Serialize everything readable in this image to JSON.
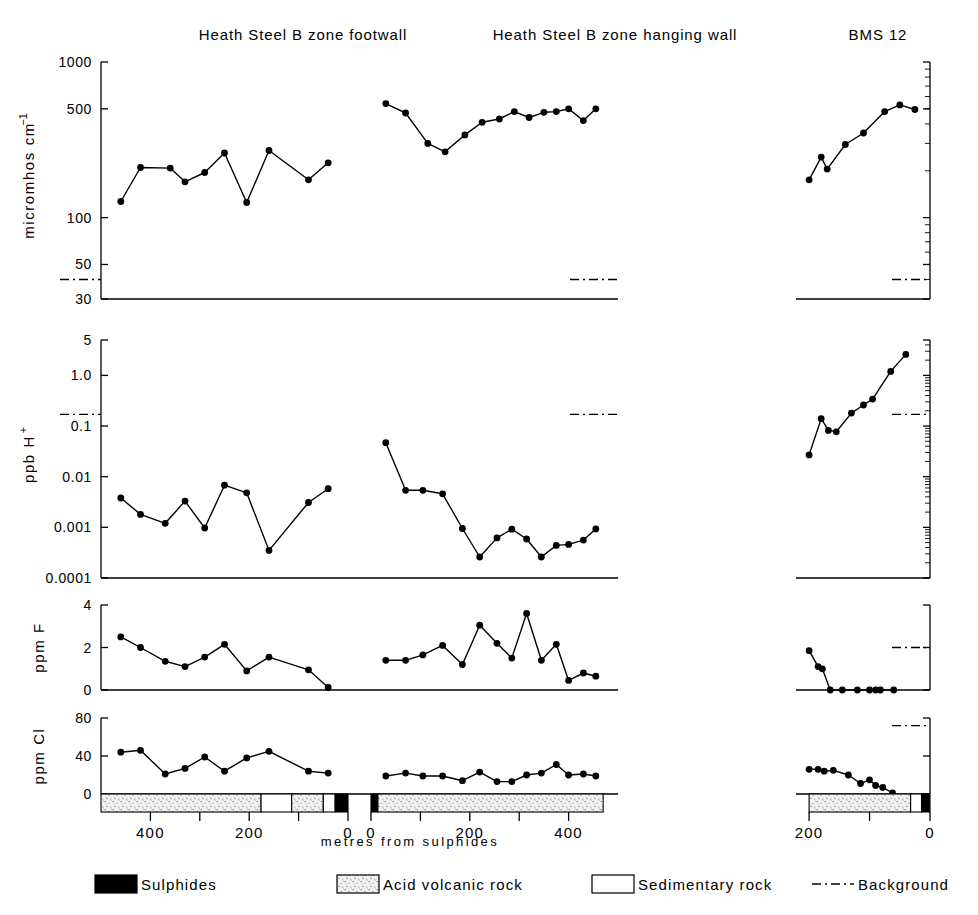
{
  "figure": {
    "xlabel": "metres from sulphides",
    "column_titles": [
      "Heath Steel B zone footwall",
      "Heath Steel B zone hanging wall",
      "BMS 12"
    ]
  },
  "legend": {
    "items": [
      {
        "label": "Sulphides",
        "swatch": "solid-black",
        "color": "#000000"
      },
      {
        "label": "Acid volcanic rock",
        "swatch": "stippled",
        "color": "#efefef"
      },
      {
        "label": "Sedimentary rock",
        "swatch": "white",
        "color": "#ffffff"
      },
      {
        "label": "Background",
        "swatch": "dash-dot-line",
        "color": "#000000"
      }
    ]
  },
  "axes": {
    "x_tick_labels_footwall": [
      "400",
      "200",
      "0"
    ],
    "x_tick_labels_hangingwall": [
      "0",
      "200",
      "400"
    ],
    "x_tick_labels_bms12": [
      "200",
      "0"
    ],
    "panel1_ticks": [
      "1000",
      "500",
      "100",
      "50",
      "30"
    ],
    "panel2_ticks": [
      "5",
      "1.0",
      "0.1",
      "0.01",
      "0.001",
      "0.0001"
    ],
    "panel3_ticks": [
      "4",
      "2",
      "0"
    ],
    "panel4_ticks": [
      "80",
      "40",
      "0"
    ]
  },
  "chart_data": [
    {
      "type": "line",
      "title": "micromhos cm-1",
      "ylabel": "micromhos cm⁻¹",
      "xlabel": "metres from sulphides",
      "yscale": "log",
      "ylim": [
        30,
        1000
      ],
      "yticks": [
        30,
        50,
        100,
        500,
        1000
      ],
      "ytick_labels": [
        "30",
        "50",
        "100",
        "500",
        "1000"
      ],
      "grid": false,
      "background_value": 40,
      "series": [
        {
          "name": "Heath Steel B zone footwall",
          "x": [
            460,
            420,
            360,
            330,
            290,
            250,
            205,
            160,
            80,
            40
          ],
          "values": [
            127,
            210,
            208,
            170,
            195,
            260,
            125,
            270,
            175,
            225
          ]
        },
        {
          "name": "Heath Steel B zone hanging wall",
          "x": [
            30,
            70,
            115,
            150,
            190,
            225,
            260,
            290,
            320,
            350,
            375,
            400,
            430,
            455
          ],
          "values": [
            540,
            470,
            300,
            265,
            340,
            410,
            430,
            480,
            440,
            475,
            480,
            500,
            420,
            500
          ]
        },
        {
          "name": "BMS 12",
          "x": [
            200,
            180,
            170,
            140,
            110,
            75,
            50,
            25
          ],
          "values": [
            175,
            245,
            205,
            295,
            350,
            480,
            530,
            495
          ]
        }
      ]
    },
    {
      "type": "line",
      "title": "ppb H+",
      "ylabel": "ppb H⁺",
      "xlabel": "metres from sulphides",
      "yscale": "log",
      "ylim": [
        0.0001,
        5
      ],
      "yticks": [
        0.0001,
        0.001,
        0.01,
        0.1,
        1.0,
        5
      ],
      "ytick_labels": [
        "0.0001",
        "0.001",
        "0.01",
        "0.1",
        "1.0",
        "5"
      ],
      "grid": false,
      "background_value": 0.17,
      "series": [
        {
          "name": "Heath Steel B zone footwall",
          "x": [
            460,
            420,
            370,
            330,
            290,
            250,
            205,
            160,
            80,
            40
          ],
          "values": [
            0.0038,
            0.0018,
            0.0012,
            0.0033,
            0.00097,
            0.0068,
            0.0048,
            0.00035,
            0.0031,
            0.0058
          ]
        },
        {
          "name": "Heath Steel B zone hanging wall",
          "x": [
            30,
            70,
            105,
            145,
            185,
            220,
            255,
            285,
            315,
            345,
            375,
            400,
            430,
            455
          ],
          "values": [
            0.047,
            0.0054,
            0.0054,
            0.0046,
            0.00095,
            0.00026,
            0.00062,
            0.00092,
            0.00059,
            0.00026,
            0.00044,
            0.00046,
            0.00056,
            0.00093
          ]
        },
        {
          "name": "BMS 12",
          "x": [
            200,
            180,
            168,
            155,
            130,
            110,
            95,
            65,
            40
          ],
          "values": [
            0.027,
            0.14,
            0.082,
            0.077,
            0.18,
            0.26,
            0.34,
            1.2,
            2.6
          ]
        }
      ]
    },
    {
      "type": "line",
      "title": "ppm F",
      "ylabel": "ppm F",
      "xlabel": "metres from sulphides",
      "yscale": "linear",
      "ylim": [
        0,
        4
      ],
      "yticks": [
        0,
        2,
        4
      ],
      "ytick_labels": [
        "0",
        "2",
        "4"
      ],
      "grid": false,
      "background_value": 2.0,
      "series": [
        {
          "name": "Heath Steel B zone footwall",
          "x": [
            460,
            420,
            370,
            330,
            290,
            250,
            205,
            160,
            80,
            40
          ],
          "values": [
            2.5,
            2.0,
            1.35,
            1.1,
            1.55,
            2.15,
            0.9,
            1.55,
            0.95,
            0.12
          ]
        },
        {
          "name": "Heath Steel B zone hanging wall",
          "x": [
            30,
            70,
            105,
            145,
            185,
            220,
            255,
            285,
            315,
            345,
            375,
            400,
            430,
            455
          ],
          "values": [
            1.4,
            1.4,
            1.65,
            2.1,
            1.2,
            3.05,
            2.2,
            1.5,
            3.6,
            1.4,
            2.15,
            0.45,
            0.8,
            0.65
          ]
        },
        {
          "name": "BMS 12",
          "x": [
            200,
            185,
            178,
            165,
            145,
            120,
            100,
            90,
            82,
            60
          ],
          "values": [
            1.85,
            1.1,
            1.0,
            0.0,
            0.0,
            0.0,
            0.0,
            0.0,
            0.0,
            0.0
          ]
        }
      ]
    },
    {
      "type": "line",
      "title": "ppm Cl",
      "ylabel": "ppm Cl",
      "xlabel": "metres from sulphides",
      "yscale": "linear",
      "ylim": [
        0,
        80
      ],
      "yticks": [
        0,
        40,
        80
      ],
      "ytick_labels": [
        "0",
        "40",
        "80"
      ],
      "grid": false,
      "background_value": 72,
      "series": [
        {
          "name": "Heath Steel B zone footwall",
          "x": [
            460,
            420,
            370,
            330,
            290,
            250,
            205,
            160,
            80,
            40
          ],
          "values": [
            44,
            46,
            21,
            27,
            39,
            24,
            38,
            45,
            24,
            22
          ]
        },
        {
          "name": "Heath Steel B zone hanging wall",
          "x": [
            30,
            70,
            105,
            145,
            185,
            220,
            255,
            285,
            315,
            345,
            375,
            400,
            430,
            455
          ],
          "values": [
            19,
            22,
            19,
            19,
            14,
            23,
            13,
            13,
            20,
            22,
            31,
            20,
            21,
            19
          ]
        },
        {
          "name": "BMS 12",
          "x": [
            200,
            185,
            175,
            160,
            135,
            115,
            100,
            90,
            78,
            62
          ],
          "values": [
            26,
            26,
            24,
            25,
            20,
            11,
            15,
            9,
            7,
            1
          ]
        }
      ]
    }
  ],
  "lithology": {
    "footwall": [
      {
        "type": "acid-volcanic",
        "from": 500,
        "to": 176
      },
      {
        "type": "sedimentary",
        "from": 176,
        "to": 114
      },
      {
        "type": "acid-volcanic",
        "from": 114,
        "to": 50
      },
      {
        "type": "sedimentary",
        "from": 50,
        "to": 26
      },
      {
        "type": "sulphides",
        "from": 26,
        "to": 0
      }
    ],
    "hangingwall": [
      {
        "type": "sulphides",
        "from": 0,
        "to": 14
      },
      {
        "type": "acid-volcanic",
        "from": 14,
        "to": 470
      }
    ],
    "bms12": [
      {
        "type": "acid-volcanic",
        "from": 200,
        "to": 32
      },
      {
        "type": "sedimentary",
        "from": 32,
        "to": 14
      },
      {
        "type": "sulphides",
        "from": 14,
        "to": 0
      }
    ]
  }
}
